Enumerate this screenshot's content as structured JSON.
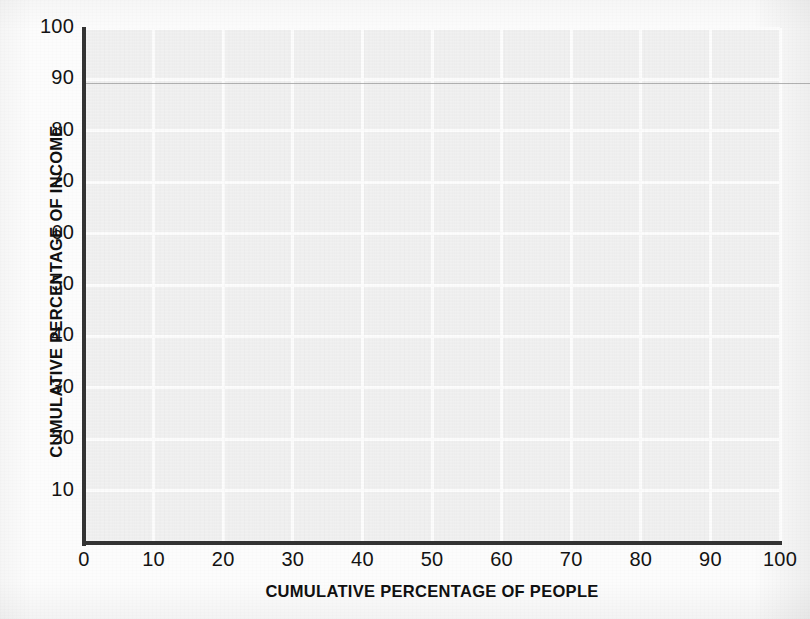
{
  "chart_data": {
    "type": "line",
    "title": "",
    "subtitle": "",
    "xlabel": "CUMULATIVE PERCENTAGE OF PEOPLE",
    "ylabel": "CUMULATIVE PERCENTAGE OF INCOME",
    "xlim": [
      0,
      100
    ],
    "ylim": [
      0,
      100
    ],
    "x_ticks": [
      0,
      10,
      20,
      30,
      40,
      50,
      60,
      70,
      80,
      90,
      100
    ],
    "y_ticks": [
      10,
      20,
      30,
      40,
      50,
      60,
      70,
      80,
      90,
      100
    ],
    "x_tick_labels": [
      "0",
      "10",
      "20",
      "30",
      "40",
      "50",
      "60",
      "70",
      "80",
      "90",
      "100"
    ],
    "y_tick_labels": [
      "10",
      "20",
      "30",
      "40",
      "50",
      "60",
      "70",
      "80",
      "90",
      "100"
    ],
    "grid": true,
    "grid_color": "#fdfdfd",
    "plot_background": "#f1f1f1",
    "axis_color": "#333333",
    "legend": null,
    "legend_position": "none",
    "series": [],
    "annotations": [],
    "note": "Blank Lorenz-curve worksheet grid: axes, gridlines and tick labels only; no data series plotted."
  },
  "axes": {
    "x_title": "CUMULATIVE PERCENTAGE OF PEOPLE",
    "y_title": "CUMULATIVE PERCENTAGE OF INCOME"
  }
}
